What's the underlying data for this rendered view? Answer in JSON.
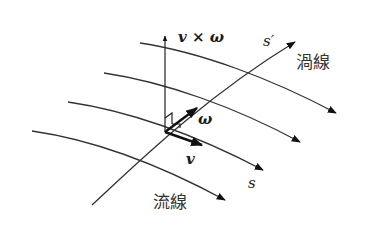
{
  "figure": {
    "labels": {
      "v_cross_omega": "v × ω",
      "omega": "ω",
      "v": "v",
      "s": "s",
      "s_prime": "s′",
      "vortex_line": "渦線",
      "streamline": "流線"
    },
    "colors": {
      "line": "#333333",
      "vector": "#111111",
      "background": "#ffffff"
    },
    "streamlines_count": 4,
    "vortex_lines_count": 1
  }
}
